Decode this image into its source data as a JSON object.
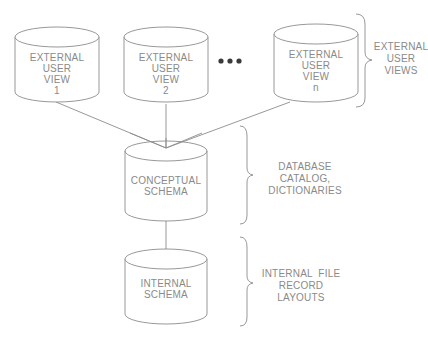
{
  "diagram": {
    "type": "three-schema-architecture",
    "external_views": [
      {
        "id": "view-1",
        "lines": [
          "EXTERNAL",
          "USER",
          "VIEW",
          "1"
        ]
      },
      {
        "id": "view-2",
        "lines": [
          "EXTERNAL",
          "USER",
          "VIEW",
          "2"
        ]
      },
      {
        "id": "view-n",
        "lines": [
          "EXTERNAL",
          "USER",
          "VIEW",
          "n"
        ]
      }
    ],
    "ellipsis": "•••",
    "conceptual": {
      "lines": [
        "CONCEPTUAL",
        "SCHEMA"
      ]
    },
    "internal": {
      "lines": [
        "INTERNAL",
        "SCHEMA"
      ]
    },
    "annotations": [
      {
        "id": "external-user-views",
        "lines": [
          "EXTERNAL",
          "USER",
          "VIEWS"
        ]
      },
      {
        "id": "database-catalog",
        "lines": [
          "DATABASE",
          "CATALOG,",
          "DICTIONARIES"
        ]
      },
      {
        "id": "internal-file-layouts",
        "lines": [
          "INTERNAL  FILE",
          "RECORD",
          "LAYOUTS"
        ]
      }
    ],
    "colors": {
      "line": "#8c8c8c",
      "text": "#8a8a8a",
      "dots": "#3a3a3a",
      "background": "#ffffff"
    }
  }
}
